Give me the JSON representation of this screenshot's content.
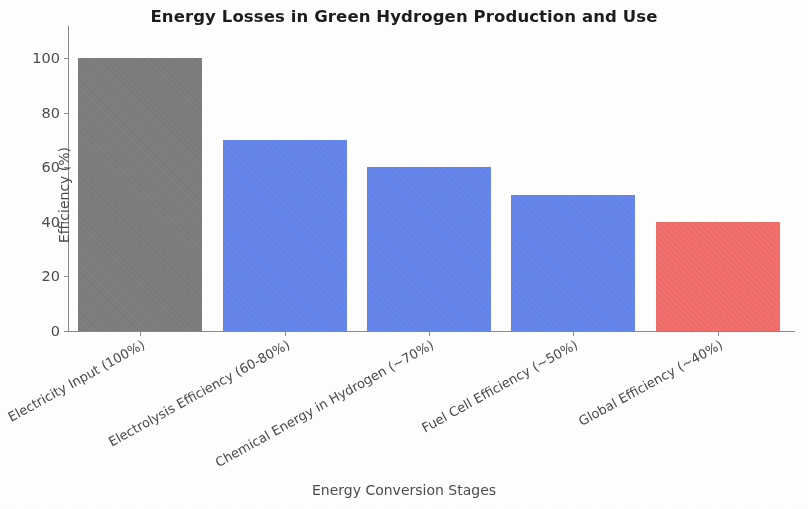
{
  "chart_data": {
    "type": "bar",
    "title": "Energy Losses in Green Hydrogen Production and Use",
    "xlabel": "Energy Conversion Stages",
    "ylabel": "Efficiency (%)",
    "categories": [
      "Electricity Input (100%)",
      "Electrolysis Efficiency (60-80%)",
      "Chemical Energy in Hydrogen (~70%)",
      "Fuel Cell Efficiency (~50%)",
      "Global Efficiency (~40%)"
    ],
    "values": [
      100,
      70,
      60,
      50,
      40
    ],
    "bar_colors": [
      "#808080",
      "#6688ee",
      "#6688ee",
      "#6688ee",
      "#f4716e"
    ],
    "ylim": [
      0,
      100
    ],
    "yticks": [
      0,
      20,
      40,
      60,
      80,
      100
    ],
    "ytick_labels": [
      "0",
      "20",
      "40",
      "60",
      "80",
      "100"
    ],
    "grid": false,
    "legend": "none",
    "background_color": "#ffffff",
    "axis_color": "#8a8a8a"
  }
}
